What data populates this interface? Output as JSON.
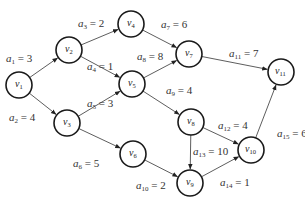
{
  "diagram": {
    "type": "weighted directed graph (AOE network)",
    "nodes": [
      {
        "id": "v1",
        "label": "v",
        "sub": "1",
        "x": 19,
        "y": 85
      },
      {
        "id": "v2",
        "label": "v",
        "sub": "2",
        "x": 69,
        "y": 50
      },
      {
        "id": "v3",
        "label": "v",
        "sub": "3",
        "x": 67,
        "y": 123
      },
      {
        "id": "v4",
        "label": "v",
        "sub": "4",
        "x": 131,
        "y": 24
      },
      {
        "id": "v5",
        "label": "v",
        "sub": "5",
        "x": 132,
        "y": 84
      },
      {
        "id": "v6",
        "label": "v",
        "sub": "6",
        "x": 133,
        "y": 154
      },
      {
        "id": "v7",
        "label": "v",
        "sub": "7",
        "x": 189,
        "y": 54
      },
      {
        "id": "v8",
        "label": "v",
        "sub": "8",
        "x": 191,
        "y": 122
      },
      {
        "id": "v9",
        "label": "v",
        "sub": "9",
        "x": 190,
        "y": 183
      },
      {
        "id": "v10",
        "label": "v",
        "sub": "10",
        "x": 251,
        "y": 150
      },
      {
        "id": "v11",
        "label": "v",
        "sub": "11",
        "x": 281,
        "y": 72
      }
    ],
    "edges": [
      {
        "id": "a1",
        "from": "v1",
        "to": "v2",
        "sub": "1",
        "weight": "3",
        "lx": 6,
        "ly": 62
      },
      {
        "id": "a2",
        "from": "v1",
        "to": "v3",
        "sub": "2",
        "weight": "4",
        "lx": 9,
        "ly": 121
      },
      {
        "id": "a3",
        "from": "v2",
        "to": "v4",
        "sub": "3",
        "weight": "2",
        "lx": 78,
        "ly": 27
      },
      {
        "id": "a4",
        "from": "v2",
        "to": "v5",
        "sub": "4",
        "weight": "1",
        "lx": 87,
        "ly": 70
      },
      {
        "id": "a5",
        "from": "v3",
        "to": "v5",
        "sub": "5",
        "weight": "3",
        "lx": 87,
        "ly": 107
      },
      {
        "id": "a6",
        "from": "v3",
        "to": "v6",
        "sub": "6",
        "weight": "5",
        "lx": 73,
        "ly": 167
      },
      {
        "id": "a7",
        "from": "v4",
        "to": "v7",
        "sub": "7",
        "weight": "6",
        "lx": 161,
        "ly": 28
      },
      {
        "id": "a8",
        "from": "v5",
        "to": "v7",
        "sub": "8",
        "weight": "8",
        "lx": 137,
        "ly": 60
      },
      {
        "id": "a9",
        "from": "v5",
        "to": "v8",
        "sub": "9",
        "weight": "4",
        "lx": 166,
        "ly": 94
      },
      {
        "id": "a10",
        "from": "v6",
        "to": "v9",
        "sub": "10",
        "weight": "2",
        "lx": 136,
        "ly": 189
      },
      {
        "id": "a11",
        "from": "v7",
        "to": "v11",
        "sub": "11",
        "weight": "7",
        "lx": 229,
        "ly": 57
      },
      {
        "id": "a12",
        "from": "v8",
        "to": "v10",
        "sub": "12",
        "weight": "4",
        "lx": 218,
        "ly": 129
      },
      {
        "id": "a13",
        "from": "v8",
        "to": "v9",
        "sub": "13",
        "weight": "10",
        "lx": 193,
        "ly": 155
      },
      {
        "id": "a14",
        "from": "v9",
        "to": "v10",
        "sub": "14",
        "weight": "1",
        "lx": 220,
        "ly": 186
      },
      {
        "id": "a15",
        "from": "v10",
        "to": "v11",
        "sub": "15",
        "weight": "6",
        "lx": 277,
        "ly": 137
      }
    ],
    "node_radius": 13,
    "colors": {
      "stroke": "#1a1a1a",
      "edge": "#333333",
      "background": "#ffffff"
    }
  }
}
